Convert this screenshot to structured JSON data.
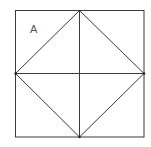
{
  "diagram": {
    "label": "A",
    "colors": {
      "line": "#3a3a3a",
      "label": "#555555",
      "background": "#ffffff"
    },
    "square": {
      "x1": 15,
      "y1": 10,
      "x2": 144,
      "y2": 137
    },
    "center": {
      "x": 79,
      "y": 73
    },
    "diamond_vertices": [
      {
        "x": 79,
        "y": 10
      },
      {
        "x": 144,
        "y": 73
      },
      {
        "x": 79,
        "y": 137
      },
      {
        "x": 15,
        "y": 73
      }
    ]
  }
}
